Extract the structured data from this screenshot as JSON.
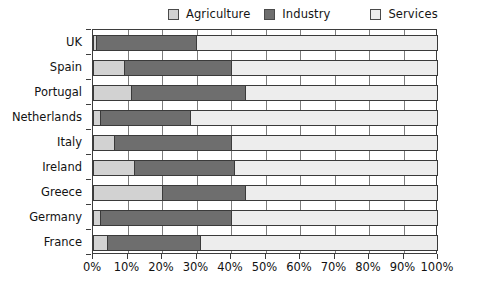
{
  "chart_data": {
    "type": "bar",
    "orientation": "horizontal",
    "stacked": true,
    "normalized_percent": true,
    "title": "",
    "xlabel": "",
    "ylabel": "",
    "xlim": [
      0,
      100
    ],
    "grid": true,
    "legend_position": "top",
    "categories": [
      "UK",
      "Spain",
      "Portugal",
      "Netherlands",
      "Italy",
      "Ireland",
      "Greece",
      "Germany",
      "France"
    ],
    "series": [
      {
        "name": "Agriculture",
        "color": "#d2d2d2",
        "values": [
          1,
          9,
          11,
          2,
          6,
          12,
          20,
          2,
          4
        ]
      },
      {
        "name": "Industry",
        "color": "#6e6e6e",
        "values": [
          29,
          31,
          33,
          26,
          34,
          29,
          24,
          38,
          27
        ]
      },
      {
        "name": "Services",
        "color": "#ededed",
        "values": [
          70,
          60,
          56,
          72,
          60,
          59,
          56,
          60,
          69
        ]
      }
    ],
    "cumulative_boundaries": {
      "UK": [
        1,
        30,
        100
      ],
      "Spain": [
        9,
        40,
        100
      ],
      "Portugal": [
        11,
        44,
        100
      ],
      "Netherlands": [
        2,
        28,
        100
      ],
      "Italy": [
        6,
        40,
        100
      ],
      "Ireland": [
        12,
        41,
        100
      ],
      "Greece": [
        20,
        44,
        100
      ],
      "Germany": [
        2,
        40,
        100
      ],
      "France": [
        4,
        31,
        100
      ]
    },
    "x_ticks": [
      0,
      10,
      20,
      30,
      40,
      50,
      60,
      70,
      80,
      90,
      100
    ],
    "x_tick_labels": [
      "0%",
      "10%",
      "20%",
      "30%",
      "40%",
      "50%",
      "60%",
      "70%",
      "80%",
      "90%",
      "100%"
    ]
  },
  "legend": {
    "items": [
      {
        "label": "Agriculture",
        "color": "#d2d2d2"
      },
      {
        "label": "Industry",
        "color": "#6e6e6e"
      },
      {
        "label": "Services",
        "color": "#ededed"
      }
    ]
  }
}
